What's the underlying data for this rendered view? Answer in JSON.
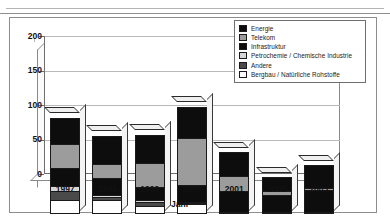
{
  "page": {
    "header_ghost_text": "",
    "background": "#ffffff"
  },
  "chart_data": {
    "type": "bar",
    "subtype": "stacked-bar-3d",
    "title": "",
    "xlabel": "Jahr",
    "ylabel": "",
    "ylim": [
      0,
      200
    ],
    "yticks": [
      0,
      50,
      100,
      150,
      200
    ],
    "grid": true,
    "legend_position": "top-right",
    "categories": [
      "1997",
      "1998",
      "1999",
      "2000",
      "2001",
      "2002",
      "2003"
    ],
    "series": [
      {
        "name": "Bergbau / Natürliche Rohstoffe",
        "color": "#ffffff",
        "fill": "f-white",
        "values": [
          21,
          20,
          12,
          14,
          2,
          2,
          3
        ]
      },
      {
        "name": "Andere",
        "color": "#4a4a4a",
        "fill": "f-dkgray",
        "values": [
          14,
          6,
          7,
          3,
          1,
          1,
          1
        ]
      },
      {
        "name": "Petrochemie / Chemische Industrie",
        "color": "#d6d6d6",
        "fill": "f-ltgray",
        "values": [
          8,
          5,
          4,
          3,
          1,
          1,
          1
        ]
      },
      {
        "name": "Infrastruktur",
        "color": "#0d0d0d",
        "fill": "f-black",
        "values": [
          28,
          26,
          20,
          26,
          31,
          25,
          32
        ]
      },
      {
        "name": "Telekom",
        "color": "#9c9c9c",
        "fill": "f-medgray",
        "values": [
          36,
          22,
          37,
          70,
          23,
          8,
          5
        ]
      },
      {
        "name": "Energie",
        "color": "#0d0d0d",
        "fill": "f-black",
        "values": [
          40,
          42,
          42,
          46,
          37,
          22,
          35
        ]
      }
    ],
    "totals": [
      147,
      121,
      122,
      162,
      95,
      59,
      77
    ]
  },
  "legend": {
    "items": [
      {
        "label": "Energie",
        "swatch": "f-black"
      },
      {
        "label": "Telekom",
        "swatch": "f-medgray"
      },
      {
        "label": "Infrastruktur",
        "swatch": "f-black"
      },
      {
        "label": "Petrochemie / Chemische Industrie",
        "swatch": "f-ltgray"
      },
      {
        "label": "Andere",
        "swatch": "f-dkgray"
      },
      {
        "label": "Bergbau / Natürliche Rohstoffe",
        "swatch": "f-white"
      }
    ]
  }
}
